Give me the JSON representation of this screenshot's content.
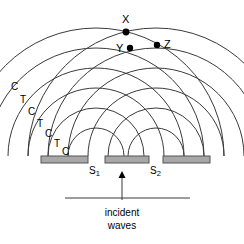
{
  "figure": {
    "background_color": "#ffffff",
    "stroke_color": "#3a3a3a",
    "text_color": "#000000",
    "barrier_fill": "#a8a8a8",
    "barrier_stroke": "#555555"
  },
  "points": [
    {
      "id": "X",
      "label": "X",
      "x": 126,
      "y": 32,
      "label_x": 122,
      "label_y": 14,
      "dot_r": 3.4
    },
    {
      "id": "Y",
      "label": "Y",
      "x": 130,
      "y": 48,
      "label_x": 116,
      "label_y": 43,
      "dot_r": 3.2
    },
    {
      "id": "Z",
      "label": "Z",
      "x": 157,
      "y": 45,
      "label_x": 164,
      "label_y": 39,
      "dot_r": 3.2
    }
  ],
  "wave_labels": [
    {
      "text": "C",
      "x": 11,
      "y": 82
    },
    {
      "text": "T",
      "x": 20,
      "y": 95
    },
    {
      "text": "C",
      "x": 28,
      "y": 107
    },
    {
      "text": "T",
      "x": 37,
      "y": 119
    },
    {
      "text": "C",
      "x": 45,
      "y": 129
    },
    {
      "text": "T",
      "x": 54,
      "y": 139
    },
    {
      "text": "C",
      "x": 62,
      "y": 147
    }
  ],
  "legend_meaning": {
    "C": "crest",
    "T": "trough"
  },
  "barriers": [
    {
      "id": "barrier-left",
      "x": 41,
      "y": 156,
      "w": 47,
      "h": 7
    },
    {
      "id": "barrier-middle",
      "x": 105,
      "y": 156,
      "w": 44,
      "h": 7
    },
    {
      "id": "barrier-right",
      "x": 163,
      "y": 156,
      "w": 47,
      "h": 7
    }
  ],
  "slits": [
    {
      "id": "S1",
      "label": "S",
      "subscript": "1",
      "cx": 96,
      "cy": 156,
      "label_x": 89,
      "label_y": 166
    },
    {
      "id": "S2",
      "label": "S",
      "subscript": "2",
      "cx": 156,
      "cy": 156,
      "label_x": 150,
      "label_y": 166
    }
  ],
  "arcs": {
    "radii": [
      28,
      48,
      68,
      88,
      108,
      128
    ],
    "source_y": 156,
    "sources_x": [
      96,
      156
    ]
  },
  "incident": {
    "arrow": {
      "x": 122,
      "y_start": 200,
      "y_end": 171
    },
    "wavefront_line": {
      "x1": 65,
      "x2": 190,
      "y": 198
    },
    "line1": "incident",
    "line2": "waves",
    "label_x": 122,
    "label_y": 207
  }
}
